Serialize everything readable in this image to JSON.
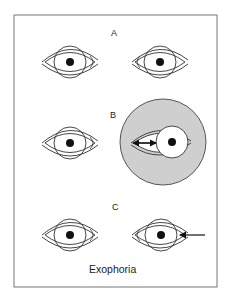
{
  "figure": {
    "panels": [
      {
        "label": "A",
        "description": "Both eyes aligned, straight ahead"
      },
      {
        "label": "B",
        "description": "Cover on right eye; covered eye drifts outward (arrow pointing out)"
      },
      {
        "label": "C",
        "description": "Cover removed; eye moves back inward to refixate (arrow pointing in)"
      }
    ],
    "caption": "Exophoria",
    "colors": {
      "line": "#333333",
      "cover": "#cfcfcf",
      "pupil": "#111111",
      "frame": "#777777"
    }
  }
}
